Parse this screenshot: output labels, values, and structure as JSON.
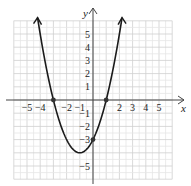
{
  "chart_data": {
    "type": "line",
    "title": "",
    "xlabel": "x",
    "ylabel": "y",
    "xlim": [
      -6,
      6
    ],
    "ylim": [
      -6,
      6
    ],
    "grid": true,
    "equation": "y = x^2 + 2x - 3",
    "x_tick_labels": [
      "-5",
      "-4",
      "-2",
      "-1",
      "2",
      "3",
      "4",
      "5"
    ],
    "x_tick_values": [
      -5,
      -4,
      -2,
      -1,
      2,
      3,
      4,
      5
    ],
    "y_tick_labels": [
      "5",
      "4",
      "3",
      "2",
      "1",
      "-1",
      "-2",
      "-3",
      "-5"
    ],
    "y_tick_values": [
      5,
      4,
      3,
      2,
      1,
      -1,
      -2,
      -3,
      -5
    ],
    "series": [
      {
        "name": "parabola",
        "x": [
          -4.2,
          -4,
          -3,
          -2,
          -1,
          0,
          1,
          2,
          2.2
        ],
        "y": [
          5.24,
          5,
          0,
          -3,
          -4,
          -3,
          0,
          5,
          6.24
        ]
      }
    ],
    "points": [
      {
        "label": "x-intercept",
        "x": -3,
        "y": 0
      },
      {
        "label": "x-intercept",
        "x": 1,
        "y": 0
      },
      {
        "label": "y-intercept",
        "x": 0,
        "y": -3
      }
    ],
    "vertex": {
      "x": -1,
      "y": -4
    }
  }
}
